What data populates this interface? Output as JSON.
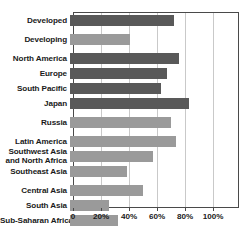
{
  "chart_data": {
    "type": "bar",
    "orientation": "horizontal",
    "title": "",
    "subtitle": "",
    "xlabel": "",
    "ylabel": "",
    "xlim": [
      0,
      110
    ],
    "grid": true,
    "legend": null,
    "xticks": [
      {
        "value": 0,
        "label": "0"
      },
      {
        "value": 20,
        "label": "20%"
      },
      {
        "value": 40,
        "label": "40%"
      },
      {
        "value": 60,
        "label": "60%"
      },
      {
        "value": 80,
        "label": "80%"
      },
      {
        "value": 100,
        "label": "100%"
      }
    ],
    "colors": {
      "dark": "#595959",
      "light": "#9a9a9a",
      "frame": "#4a4a4a",
      "gridline": "#c9c9c9",
      "background": "#ffffff",
      "text": "#1a1a1a"
    },
    "categories": [
      "Developed",
      "Developing",
      "North America",
      "Europe",
      "South Pacific",
      "Japan",
      "Russia",
      "Latin America",
      "Southwest Asia and North Africa",
      "Southeast Asia",
      "Central Asia",
      "South Asia",
      "Sub-Saharan Africa"
    ],
    "values": [
      74,
      43,
      78,
      69,
      65,
      85,
      72,
      76,
      59,
      41,
      52,
      28,
      34
    ],
    "bars": [
      {
        "label": "Developed",
        "value": 74,
        "shade": "dark",
        "gap_after": true
      },
      {
        "label": "Developing",
        "value": 43,
        "shade": "light",
        "gap_after": true
      },
      {
        "label": "North America",
        "value": 78,
        "shade": "dark",
        "gap_after": false
      },
      {
        "label": "Europe",
        "value": 69,
        "shade": "dark",
        "gap_after": false
      },
      {
        "label": "South Pacific",
        "value": 65,
        "shade": "dark",
        "gap_after": false
      },
      {
        "label": "Japan",
        "value": 85,
        "shade": "dark",
        "gap_after": true
      },
      {
        "label": "Russia",
        "value": 72,
        "shade": "light",
        "gap_after": true
      },
      {
        "label": "Latin America",
        "value": 76,
        "shade": "light",
        "gap_after": false
      },
      {
        "label": "Southwest Asia and North Africa",
        "value": 59,
        "shade": "light",
        "gap_after": false,
        "two_line": true,
        "line1": "Southwest Asia",
        "line2": "and North Africa"
      },
      {
        "label": "Southeast Asia",
        "value": 41,
        "shade": "light",
        "gap_after": true
      },
      {
        "label": "Central Asia",
        "value": 52,
        "shade": "light",
        "gap_after": false
      },
      {
        "label": "South Asia",
        "value": 28,
        "shade": "light",
        "gap_after": false
      },
      {
        "label": "Sub-Saharan Africa",
        "value": 34,
        "shade": "light",
        "gap_after": false
      }
    ]
  }
}
